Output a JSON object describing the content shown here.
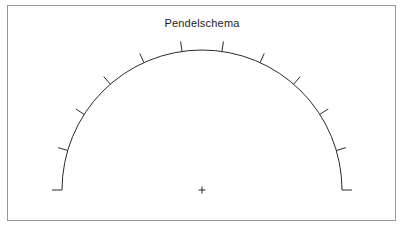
{
  "figure": {
    "title": "Pendelschema",
    "frame": {
      "x": 7,
      "y": 5,
      "width": 389,
      "height": 216,
      "stroke_color": "#9a9a9a",
      "stroke_width": 1,
      "background": "#ffffff"
    }
  },
  "chart_data": {
    "type": "diagram",
    "title": "Pendelschema",
    "subtitle": "",
    "xlabel": "",
    "ylabel": "",
    "grid": false,
    "legend": "none",
    "background": "#ffffff",
    "stroke_color": "#2b2b2b",
    "pivot": {
      "label": "+",
      "x": 202,
      "y": 190,
      "marker": "plus",
      "size": 7
    },
    "arc": {
      "center_x": 202,
      "center_y": 190,
      "radius": 140,
      "start_angle_deg": 180,
      "end_angle_deg": 0,
      "sweep_deg": 180,
      "stroke_width": 1
    },
    "ticks": {
      "count": 12,
      "length": 10,
      "direction": "outward",
      "stroke_width": 1,
      "angles_deg": [
        180,
        163.6,
        147.3,
        130.9,
        114.5,
        98.2,
        81.8,
        65.5,
        49.1,
        32.7,
        16.4,
        0
      ]
    },
    "xlim": [
      62,
      342
    ],
    "ylim": [
      50,
      190
    ]
  }
}
